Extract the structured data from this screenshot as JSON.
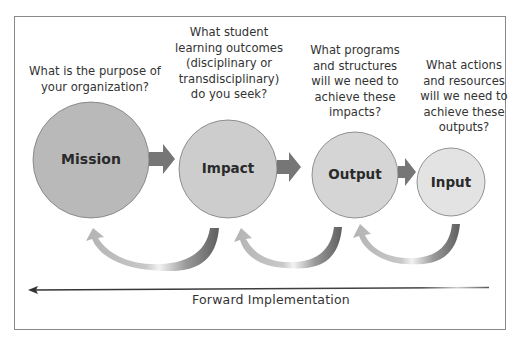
{
  "diagram": {
    "stages": [
      {
        "id": "mission",
        "label": "Mission",
        "question": "What is the purpose of your organization?",
        "question_lines": [
          "What is the purpose of",
          "your organization?"
        ],
        "fill": "#b9b9b9"
      },
      {
        "id": "impact",
        "label": "Impact",
        "question": "What student learning outcomes (disciplinary or transdisciplinary) do you seek?",
        "question_lines": [
          "What student",
          "learning outcomes",
          "(disciplinary or",
          "transdisciplinary)",
          "do you seek?"
        ],
        "fill": "#cdcdcd"
      },
      {
        "id": "output",
        "label": "Output",
        "question": "What programs and structures will we need to achieve these impacts?",
        "question_lines": [
          "What programs",
          "and structures",
          "will we need to",
          "achieve these",
          "impacts?"
        ],
        "fill": "#d5d5d5"
      },
      {
        "id": "input",
        "label": "Input",
        "question": "What actions and resources will we need to achieve these outputs?",
        "question_lines": [
          "What actions",
          "and resources",
          "will we need to",
          "achieve these",
          "outputs?"
        ],
        "fill": "#e3e3e3"
      }
    ],
    "forward_arrow_label": "Forward Implementation",
    "colors": {
      "frame": "#8a8a8a",
      "circle_stroke": "#7a7a7a",
      "flow_arrow": "#777777",
      "return_arrow_light": "#b0b0b0",
      "return_arrow_dark": "#6e6e6e",
      "forward_line": "#333333"
    }
  }
}
